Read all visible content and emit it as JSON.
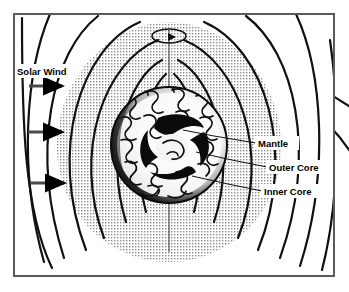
{
  "figure": {
    "kind": "scientific-diagram",
    "background_color": "#ffffff",
    "ink_color": "#000000",
    "frame": {
      "name": "diagram-border",
      "x": 13,
      "y": 13,
      "width": 322,
      "height": 264,
      "stroke": "#5a5a5a",
      "stroke_width": 2,
      "fill": "#ffffff"
    }
  },
  "labels": {
    "solar_wind": "Solar Wind",
    "mantle": "Mantle",
    "outer_core": "Outer Core",
    "inner_core": "Inner Core"
  },
  "annotations": [
    {
      "id": "solar-wind",
      "text": "Solar Wind",
      "x": 17,
      "y": 74,
      "font_size": 9.5,
      "anchor": "start"
    },
    {
      "id": "mantle",
      "text": "Mantle",
      "x": 258,
      "y": 146,
      "font_size": 9.5,
      "anchor": "start"
    },
    {
      "id": "outer-core",
      "text": "Outer Core",
      "x": 269,
      "y": 170,
      "font_size": 9.5,
      "anchor": "start"
    },
    {
      "id": "inner-core",
      "text": "Inner Core",
      "x": 264,
      "y": 194,
      "font_size": 9.5,
      "anchor": "start"
    }
  ],
  "leader_lines": [
    {
      "id": "mantle-leader",
      "from": [
        256,
        143
      ],
      "to": [
        183,
        130
      ]
    },
    {
      "id": "outer-core-leader",
      "from": [
        267,
        167
      ],
      "to": [
        196,
        152
      ]
    },
    {
      "id": "inner-core-leader",
      "from": [
        262,
        191
      ],
      "to": [
        192,
        176
      ]
    }
  ],
  "solar_wind_arrows": [
    {
      "id": "solar-wind-arrow-1",
      "x1": 29,
      "y1": 86,
      "x2": 66,
      "y2": 86
    },
    {
      "id": "solar-wind-arrow-2",
      "x1": 28,
      "y1": 132,
      "x2": 66,
      "y2": 132
    },
    {
      "id": "solar-wind-arrow-3",
      "x1": 30,
      "y1": 183,
      "x2": 68,
      "y2": 183
    }
  ],
  "rotation_indicator": {
    "id": "rotation-arrow",
    "center": [
      169,
      36
    ],
    "rx": 17,
    "ry": 7,
    "description": "ellipse with arrowhead indicating axial rotation"
  },
  "rotation_axis": {
    "id": "rotation-axis-line",
    "x": 169,
    "y_top": 30,
    "y_bottom": 252
  },
  "earth": {
    "center": [
      169,
      145
    ],
    "radius": 58,
    "mantle_radius": 58,
    "outer_core_radius": 32,
    "inner_core_radius": 15,
    "surface_shading": "stippled-limb-darkening",
    "convection_pattern": "squiggly-cells"
  },
  "magnetosphere": {
    "id": "magnetosphere-region",
    "fill": "#d8d8d8",
    "pattern": "halftone-stipple",
    "center": [
      169,
      145
    ],
    "rx": 112,
    "ry": 128
  },
  "field_lines": {
    "count": 8,
    "stroke_width": 2.2,
    "description": "nested dipole magnetic field loops converging at poles"
  }
}
